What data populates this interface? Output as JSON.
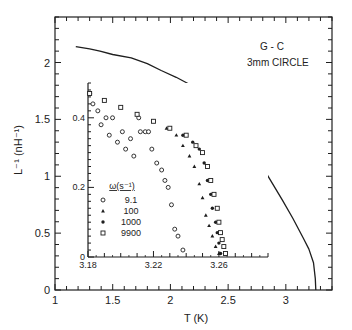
{
  "chart_data": [
    {
      "id": "main",
      "type": "line",
      "title": "",
      "xlabel": "T (K)",
      "ylabel": "L⁻¹ (nH⁻¹)",
      "xlim": [
        1,
        3.4
      ],
      "ylim": [
        0,
        2.4
      ],
      "xticks": [
        1,
        1.5,
        2,
        2.5,
        3
      ],
      "xtick_labels": [
        "1",
        "1.5",
        "2",
        "2.5",
        "3"
      ],
      "yticks": [
        0,
        0.5,
        1,
        1.5,
        2
      ],
      "ytick_labels": [
        "0",
        "0.5",
        "1",
        "1.5",
        "2"
      ],
      "grid": false,
      "annotations": [
        "G - C",
        "3mm CIRCLE"
      ],
      "series": [
        {
          "name": "L^-1 vs T",
          "x": [
            1.18,
            1.3,
            1.39,
            1.5,
            1.66,
            1.8,
            1.92,
            2.05,
            2.18,
            2.3,
            2.4,
            2.52,
            2.62,
            2.74,
            2.84,
            2.97,
            3.06,
            3.15,
            3.2,
            3.24,
            3.255,
            3.26
          ],
          "y": [
            2.14,
            2.12,
            2.1,
            2.07,
            2.04,
            1.99,
            1.93,
            1.87,
            1.8,
            1.71,
            1.61,
            1.49,
            1.36,
            1.2,
            1.01,
            0.79,
            0.63,
            0.46,
            0.36,
            0.24,
            0.1,
            0.0
          ]
        }
      ]
    },
    {
      "id": "inset",
      "type": "scatter",
      "title": "",
      "xlabel": "",
      "ylabel": "",
      "xlim": [
        3.18,
        3.29
      ],
      "ylim": [
        0,
        0.5
      ],
      "xticks": [
        3.18,
        3.22,
        3.26
      ],
      "xtick_labels": [
        "3.18",
        "3.22",
        "3.26"
      ],
      "yticks": [
        0,
        0.2,
        0.4
      ],
      "ytick_labels": [
        "0",
        "0.2",
        "0.4"
      ],
      "legend_title": "ω(s⁻¹)",
      "legend_position": "inside lower left",
      "series": [
        {
          "name": "9.1",
          "marker": "open-circle",
          "x": [
            3.181,
            3.183,
            3.186,
            3.188,
            3.191,
            3.193,
            3.195,
            3.198,
            3.201,
            3.203,
            3.206,
            3.208,
            3.211,
            3.212,
            3.215,
            3.217,
            3.219,
            3.222,
            3.225,
            3.227,
            3.229,
            3.231,
            3.233,
            3.235,
            3.238
          ],
          "y": [
            0.47,
            0.44,
            0.42,
            0.38,
            0.4,
            0.35,
            0.4,
            0.33,
            0.36,
            0.31,
            0.34,
            0.29,
            0.4,
            0.36,
            0.36,
            0.36,
            0.31,
            0.27,
            0.25,
            0.22,
            0.2,
            0.15,
            0.08,
            0.06,
            0.02
          ]
        },
        {
          "name": "100",
          "marker": "triangle",
          "x": [
            3.181,
            3.19,
            3.2,
            3.21,
            3.22,
            3.228,
            3.234,
            3.238,
            3.242,
            3.245,
            3.248,
            3.25,
            3.252,
            3.254,
            3.256,
            3.258,
            3.26
          ],
          "y": [
            0.47,
            0.45,
            0.43,
            0.41,
            0.39,
            0.37,
            0.35,
            0.32,
            0.29,
            0.26,
            0.21,
            0.17,
            0.12,
            0.09,
            0.06,
            0.03,
            0.01
          ]
        },
        {
          "name": "1000",
          "marker": "filled-circle",
          "x": [
            3.181,
            3.19,
            3.2,
            3.21,
            3.22,
            3.23,
            3.238,
            3.244,
            3.248,
            3.251,
            3.253,
            3.255,
            3.256,
            3.258,
            3.259,
            3.26,
            3.261
          ],
          "y": [
            0.47,
            0.45,
            0.43,
            0.41,
            0.39,
            0.37,
            0.35,
            0.33,
            0.31,
            0.27,
            0.22,
            0.18,
            0.14,
            0.1,
            0.07,
            0.04,
            0.01
          ]
        },
        {
          "name": "9900",
          "marker": "open-square",
          "x": [
            3.181,
            3.19,
            3.2,
            3.21,
            3.22,
            3.23,
            3.24,
            3.246,
            3.25,
            3.253,
            3.255,
            3.257,
            3.259,
            3.26,
            3.261,
            3.262,
            3.263,
            3.264
          ],
          "y": [
            0.47,
            0.45,
            0.43,
            0.41,
            0.39,
            0.37,
            0.35,
            0.32,
            0.3,
            0.26,
            0.22,
            0.18,
            0.14,
            0.1,
            0.07,
            0.05,
            0.03,
            0.01
          ]
        }
      ]
    }
  ],
  "labels": {
    "main_xlabel": "T  (K)",
    "main_ylabel": "L⁻¹ (nH⁻¹)",
    "annot_line1": "G - C",
    "annot_line2": "3mm CIRCLE",
    "legend_title": "ω(s⁻¹)",
    "legend_items": [
      "9.1",
      "100",
      "1000",
      "9900"
    ]
  }
}
